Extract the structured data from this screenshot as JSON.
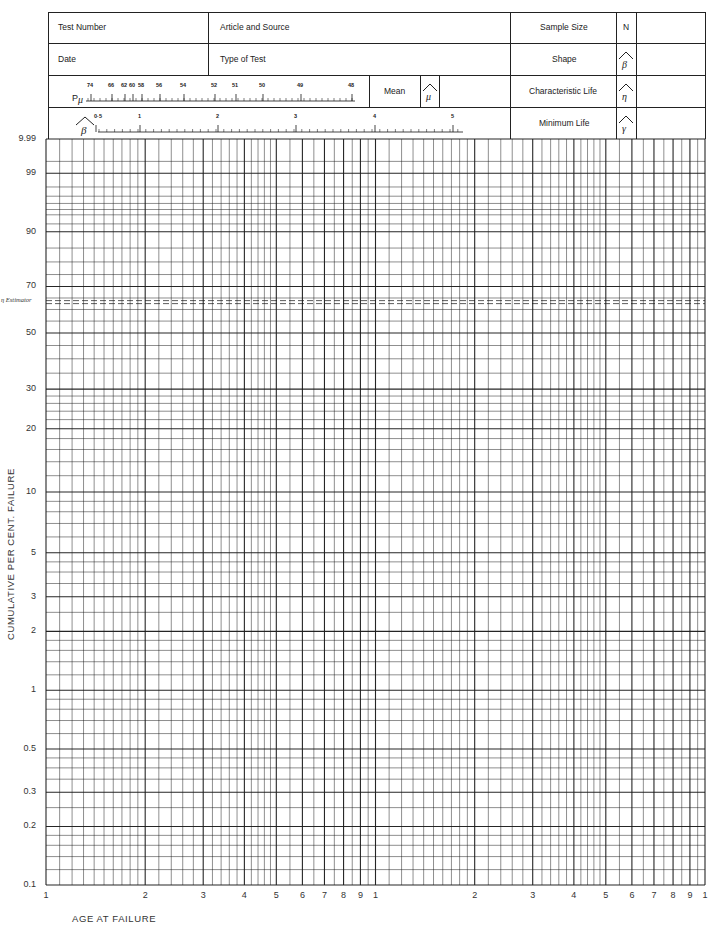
{
  "header": {
    "test_number_label": "Test Number",
    "article_source_label": "Article and Source",
    "date_label": "Date",
    "type_of_test_label": "Type of Test",
    "sample_size_label": "Sample Size",
    "sample_size_symbol": "N",
    "shape_label": "Shape",
    "characteristic_life_label": "Characteristic Life",
    "minimum_life_label": "Minimum Life",
    "mean_label": "Mean",
    "p_mu_label": "P",
    "p_mu_sub": "μ",
    "test_number_value": "",
    "article_source_value": "",
    "date_value": "",
    "type_of_test_value": "",
    "sample_size_value": "",
    "shape_value": "",
    "characteristic_life_value": "",
    "minimum_life_value": "",
    "mean_value": ""
  },
  "p_mu_scale": {
    "labels": [
      "74",
      "66",
      "62",
      "60",
      "58",
      "56",
      "54",
      "52",
      "51",
      "50",
      "49",
      "48"
    ],
    "label_x": [
      91,
      112,
      125,
      133,
      142,
      160,
      184,
      215,
      236,
      263,
      301,
      352
    ]
  },
  "beta_scale": {
    "labels": [
      "0·5",
      "1",
      "2",
      "3",
      "4",
      "5"
    ],
    "label_x": [
      96,
      140,
      218,
      296,
      375,
      453
    ]
  },
  "chart_data": {
    "type": "table",
    "xlabel": "AGE AT FAILURE",
    "ylabel": "CUMULATIVE PER CENT. FAILURE",
    "x_scale": "log, 2 cycles",
    "x_tick_labels": [
      "1",
      "2",
      "3",
      "4",
      "5",
      "6",
      "7",
      "8",
      "9",
      "1",
      "2",
      "3",
      "4",
      "5",
      "6",
      "7",
      "8",
      "9",
      "1"
    ],
    "y_scale": "weibull (ln(-ln(1-F)))",
    "y_tick_labels": [
      "99.9",
      "99",
      "90",
      "70",
      "50",
      "30",
      "20",
      "10",
      "5",
      "3",
      "2",
      "1",
      "0.5",
      "0.3",
      "0.2",
      "0.1"
    ],
    "y_tick_values": [
      99.9,
      99,
      90,
      70,
      50,
      30,
      20,
      10,
      5,
      3,
      2,
      1,
      0.5,
      0.3,
      0.2,
      0.1
    ],
    "ylim": [
      0.1,
      99.9
    ],
    "xlim": [
      1,
      100
    ],
    "annotations": [
      {
        "text": "η Estimator",
        "y": 63.2,
        "style": "dashed line"
      }
    ],
    "grid": true,
    "series": []
  },
  "y_labels_display": [
    "9.99",
    "99",
    "90",
    "70",
    "50",
    "30",
    "20",
    "10",
    "5",
    "3",
    "2",
    "1",
    "0.5",
    "0.3",
    "0.2",
    "0.1"
  ],
  "eta_label": "η Estimator",
  "colors": {
    "ink": "#1a1a1a",
    "paper": "#ffffff"
  }
}
